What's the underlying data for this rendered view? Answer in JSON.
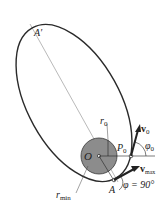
{
  "figure": {
    "labels": {
      "apoapsis": "A′",
      "initial_radius": "r",
      "initial_radius_sub": "0",
      "focus": "O",
      "launch_point": "P",
      "launch_point_sub": "0",
      "initial_velocity": "v",
      "initial_velocity_sub": "0",
      "initial_angle": "φ",
      "initial_angle_sub": "0",
      "max_velocity": "v",
      "max_velocity_sub": "max",
      "periapsis": "A",
      "periapsis_angle": "φ = 90°",
      "min_radius": "r",
      "min_radius_sub": "min"
    },
    "colors": {
      "ellipse": "#2a2a2a",
      "planet_fill": "#8c8c8c",
      "planet_stroke": "#3a3a3a",
      "axis_line": "#7a7a7a",
      "text": "#222222"
    }
  }
}
